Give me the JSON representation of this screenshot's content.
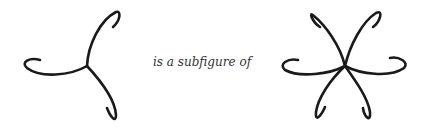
{
  "caption": "is a subfigure of",
  "colors": {
    "stroke": "#1a1a1a",
    "background": "#ffffff",
    "text": "#333333"
  },
  "figures": [
    {
      "name": "three-arm-figure",
      "arms": 3
    },
    {
      "name": "six-arm-figure",
      "arms": 6
    }
  ]
}
